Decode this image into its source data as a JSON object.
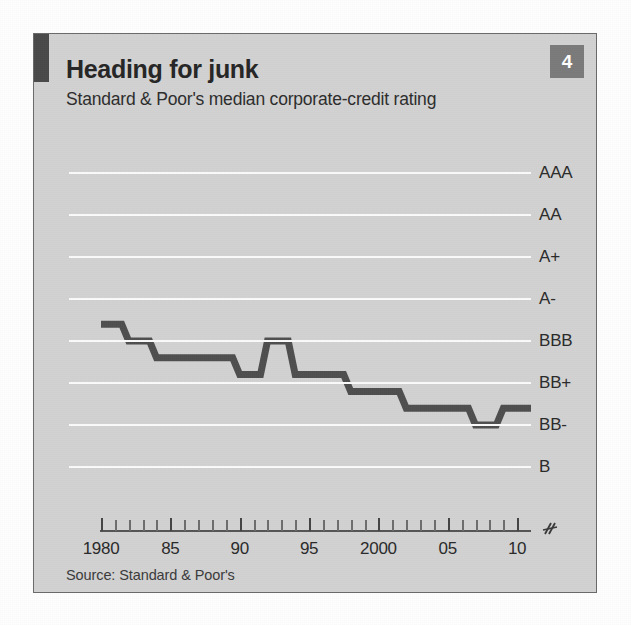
{
  "card": {
    "badge_number": "4",
    "title": "Heading for junk",
    "subtitle": "Standard & Poor's median corporate-credit rating",
    "source": "Source: Standard & Poor's",
    "axis_break_glyph": "≈"
  },
  "colors": {
    "card_background": "#d2d2d2",
    "card_border": "#6a6a6a",
    "accent_bar": "#4a4a4a",
    "badge_background": "#7b7b7b",
    "badge_text": "#ffffff",
    "title_text": "#262626",
    "gridline": "#fbfbfb",
    "series_line": "#4f4f4f",
    "axis_line": "#555555",
    "tick": "#555555"
  },
  "chart_data": {
    "type": "line",
    "title": "Heading for junk",
    "subtitle": "Standard & Poor's median corporate-credit rating",
    "xlabel": "",
    "ylabel": "",
    "grid": true,
    "legend": false,
    "source": "Source: Standard & Poor's",
    "y_categories": [
      "AAA",
      "AA",
      "A+",
      "A-",
      "BBB",
      "BB+",
      "BB-",
      "B"
    ],
    "y_axis_note": "Ordinal credit-rating scale, best (AAA) at top; axis truncated below B",
    "x_tick_labels": [
      "1980",
      "85",
      "90",
      "95",
      "2000",
      "05",
      "10"
    ],
    "x_tick_years": [
      1980,
      1985,
      1990,
      1995,
      2000,
      2005,
      2010
    ],
    "xlim": [
      1980,
      2011
    ],
    "minor_tick_interval": 1,
    "series": [
      {
        "name": "S&P median corporate-credit rating",
        "x": [
          1980,
          1981,
          1982,
          1983,
          1984,
          1985,
          1986,
          1987,
          1988,
          1989,
          1990,
          1991,
          1992,
          1993,
          1994,
          1995,
          1996,
          1997,
          1998,
          1999,
          2000,
          2001,
          2002,
          2003,
          2004,
          2005,
          2006,
          2007,
          2008,
          2009,
          2010,
          2011
        ],
        "rating_values": [
          "A",
          "A",
          "A-",
          "A-",
          "BBB+",
          "BBB+",
          "BBB+",
          "BBB+",
          "BBB+",
          "BBB+",
          "BBB",
          "BBB",
          "A-",
          "A-",
          "BBB",
          "BBB",
          "BBB",
          "BBB",
          "BBB-",
          "BBB-",
          "BBB-",
          "BBB-",
          "BB+",
          "BB+",
          "BB+",
          "BB+",
          "BB+",
          "BB",
          "BB",
          "BB+",
          "BB+",
          "BB+"
        ],
        "values": [
          3.6,
          3.6,
          4.0,
          4.0,
          4.4,
          4.4,
          4.4,
          4.4,
          4.4,
          4.4,
          4.8,
          4.8,
          4.0,
          4.0,
          4.8,
          4.8,
          4.8,
          4.8,
          5.2,
          5.2,
          5.2,
          5.2,
          5.6,
          5.6,
          5.6,
          5.6,
          5.6,
          6.0,
          6.0,
          5.6,
          5.6,
          5.6
        ],
        "value_scale_note": "values are ordinal index positions on the y_categories scale (0=AAA, 1=AA, 2=A+, 3=A-, 4=BBB, 5=BB+, 6=BB-, 7=B), interpolated for intermediate notches"
      }
    ]
  }
}
